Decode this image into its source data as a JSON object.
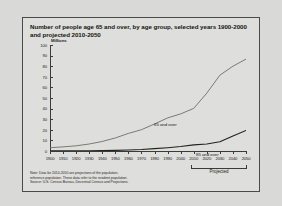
{
  "figure": {
    "title_line1": "Number of people age 65 and over, by age group, selected years 1900-2000",
    "title_line2": "and projected 2010-2050",
    "projected_label": "Projected",
    "footnote": [
      "Note: Data for 2010-2050 are projections of the population.",
      "reference population. These data refer to the resident population.",
      "Source: U.S. Census Bureau, Decennial Census and Projections."
    ]
  },
  "chart_data": {
    "type": "line",
    "title": "Number of people age 65 and over, by age group, selected years 1900-2000 and projected 2010-2050",
    "xlabel": "",
    "ylabel": "Millions",
    "ylim": [
      0,
      100
    ],
    "xlim": [
      1900,
      2050
    ],
    "ytick_labels": [
      "0",
      "10",
      "20",
      "30",
      "40",
      "50",
      "60",
      "70",
      "80",
      "90",
      "100"
    ],
    "yticks": [
      0,
      10,
      20,
      30,
      40,
      50,
      60,
      70,
      80,
      90,
      100
    ],
    "x": [
      1900,
      1910,
      1920,
      1930,
      1940,
      1950,
      1960,
      1970,
      1980,
      1990,
      2000,
      2010,
      2020,
      2030,
      2040,
      2050
    ],
    "xtick_labels": [
      "1900",
      "1910",
      "1920",
      "1930",
      "1940",
      "1950",
      "1960",
      "1970",
      "1980",
      "1990",
      "2000",
      "2010",
      "2020",
      "2030",
      "2040",
      "2050"
    ],
    "grid": false,
    "legend_position": "inline-labels",
    "projected_from": 2010,
    "series": [
      {
        "name": "65 and over",
        "color": "#6f6f68",
        "values": [
          3.1,
          3.9,
          4.9,
          6.6,
          9.0,
          12.3,
          16.6,
          20.1,
          25.5,
          31.2,
          35.0,
          40.2,
          54.6,
          71.5,
          80.0,
          86.7
        ]
      },
      {
        "name": "85 and over",
        "color": "#23231c",
        "values": [
          0.1,
          0.2,
          0.2,
          0.3,
          0.4,
          0.6,
          0.9,
          1.4,
          2.2,
          3.1,
          4.2,
          5.8,
          6.6,
          8.7,
          14.2,
          19.4
        ]
      }
    ]
  }
}
